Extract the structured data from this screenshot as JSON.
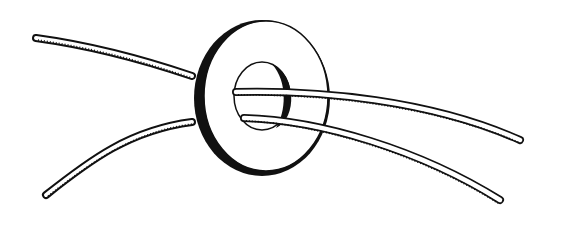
{
  "illustration": {
    "subject": "two cords threaded through a washer ring",
    "background_color": "#ffffff",
    "ink_color": "#111111",
    "cord_fill": "#ffffff",
    "width": 563,
    "height": 226
  }
}
